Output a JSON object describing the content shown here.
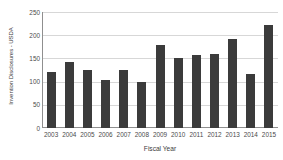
{
  "chart_data": {
    "type": "bar",
    "title": "",
    "xlabel": "Fiscal Year",
    "ylabel": "Invention Disclosures - USDA",
    "categories": [
      "2003",
      "2004",
      "2005",
      "2006",
      "2007",
      "2008",
      "2009",
      "2010",
      "2011",
      "2012",
      "2013",
      "2014",
      "2015"
    ],
    "values": [
      121,
      143,
      125,
      104,
      126,
      100,
      178,
      150,
      158,
      160,
      191,
      116,
      221
    ],
    "series": [
      {
        "name": "Invention Disclosures - USDA",
        "values": [
          121,
          143,
          125,
          104,
          126,
          100,
          178,
          150,
          158,
          160,
          191,
          116,
          221
        ]
      }
    ],
    "ylim": [
      0,
      250
    ],
    "yticks": [
      0,
      50,
      100,
      150,
      200,
      250
    ],
    "ytick_labels": [
      "0",
      "50",
      "100",
      "150",
      "200",
      "250"
    ],
    "grid": true,
    "legend": false,
    "legend_position": "none",
    "bar_color": "#3b3b3b",
    "gridline_color": "#d7d7d7",
    "axis_color": "#8f8f8f",
    "background_color": "#ffffff"
  }
}
